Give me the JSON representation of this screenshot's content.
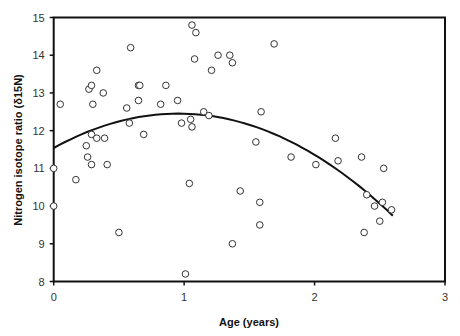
{
  "chart_data": {
    "type": "scatter",
    "title": "",
    "xlabel": "Age (years)",
    "ylabel": "Nitrogen isotope ratio (δ15N)",
    "xlim": [
      0,
      3
    ],
    "ylim": [
      8,
      15
    ],
    "x_ticks": [
      0,
      1,
      2,
      3
    ],
    "y_ticks": [
      8,
      9,
      10,
      11,
      12,
      13,
      14,
      15
    ],
    "grid": false,
    "legend": null,
    "marker": "open-circle",
    "series": [
      {
        "name": "observations",
        "points": [
          {
            "x": 0.0,
            "y": 11.0
          },
          {
            "x": 0.0,
            "y": 10.0
          },
          {
            "x": 0.05,
            "y": 12.7
          },
          {
            "x": 0.17,
            "y": 10.7
          },
          {
            "x": 0.25,
            "y": 11.6
          },
          {
            "x": 0.26,
            "y": 11.3
          },
          {
            "x": 0.27,
            "y": 13.1
          },
          {
            "x": 0.29,
            "y": 13.2
          },
          {
            "x": 0.29,
            "y": 11.9
          },
          {
            "x": 0.29,
            "y": 11.1
          },
          {
            "x": 0.3,
            "y": 12.7
          },
          {
            "x": 0.33,
            "y": 13.6
          },
          {
            "x": 0.33,
            "y": 11.8
          },
          {
            "x": 0.38,
            "y": 13.0
          },
          {
            "x": 0.39,
            "y": 11.8
          },
          {
            "x": 0.41,
            "y": 11.1
          },
          {
            "x": 0.5,
            "y": 9.3
          },
          {
            "x": 0.56,
            "y": 12.6
          },
          {
            "x": 0.58,
            "y": 12.2
          },
          {
            "x": 0.59,
            "y": 14.2
          },
          {
            "x": 0.65,
            "y": 13.2
          },
          {
            "x": 0.66,
            "y": 13.2
          },
          {
            "x": 0.65,
            "y": 12.8
          },
          {
            "x": 0.69,
            "y": 11.9
          },
          {
            "x": 0.82,
            "y": 12.7
          },
          {
            "x": 0.86,
            "y": 13.2
          },
          {
            "x": 0.95,
            "y": 12.8
          },
          {
            "x": 0.98,
            "y": 12.2
          },
          {
            "x": 1.01,
            "y": 8.2
          },
          {
            "x": 1.04,
            "y": 10.6
          },
          {
            "x": 1.05,
            "y": 12.3
          },
          {
            "x": 1.06,
            "y": 12.1
          },
          {
            "x": 1.06,
            "y": 14.8
          },
          {
            "x": 1.08,
            "y": 13.9
          },
          {
            "x": 1.09,
            "y": 14.6
          },
          {
            "x": 1.15,
            "y": 12.5
          },
          {
            "x": 1.19,
            "y": 12.4
          },
          {
            "x": 1.21,
            "y": 13.6
          },
          {
            "x": 1.26,
            "y": 14.0
          },
          {
            "x": 1.35,
            "y": 14.0
          },
          {
            "x": 1.37,
            "y": 13.8
          },
          {
            "x": 1.37,
            "y": 9.0
          },
          {
            "x": 1.43,
            "y": 10.4
          },
          {
            "x": 1.55,
            "y": 11.7
          },
          {
            "x": 1.58,
            "y": 10.1
          },
          {
            "x": 1.58,
            "y": 9.5
          },
          {
            "x": 1.59,
            "y": 12.5
          },
          {
            "x": 1.69,
            "y": 14.3
          },
          {
            "x": 1.82,
            "y": 11.3
          },
          {
            "x": 2.01,
            "y": 11.1
          },
          {
            "x": 2.16,
            "y": 11.8
          },
          {
            "x": 2.18,
            "y": 11.2
          },
          {
            "x": 2.36,
            "y": 11.3
          },
          {
            "x": 2.38,
            "y": 9.3
          },
          {
            "x": 2.4,
            "y": 10.3
          },
          {
            "x": 2.46,
            "y": 10.0
          },
          {
            "x": 2.5,
            "y": 9.6
          },
          {
            "x": 2.52,
            "y": 10.1
          },
          {
            "x": 2.53,
            "y": 11.0
          },
          {
            "x": 2.59,
            "y": 9.9
          }
        ]
      }
    ],
    "trendline": {
      "type": "polynomial-2",
      "coefficients": {
        "a": 11.54,
        "b": 1.91,
        "c": -1.0
      },
      "x_range": [
        0,
        2.6
      ]
    }
  },
  "colors": {
    "background": "#ffffff",
    "axis": "#111111",
    "marker_stroke": "#333333",
    "trendline": "#111111"
  }
}
